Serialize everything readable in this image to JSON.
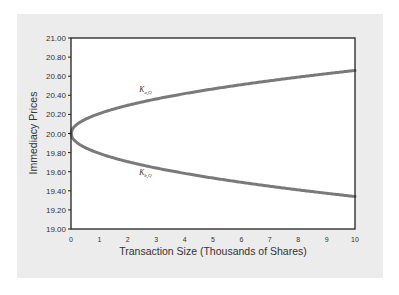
{
  "chart_data": {
    "type": "line",
    "title": "",
    "xlabel": "Transaction Size (Thousands of Shares)",
    "ylabel": "Immediacy Prices",
    "xlim": [
      0,
      10
    ],
    "ylim": [
      19.0,
      21.0
    ],
    "x_ticks": [
      "0",
      "1",
      "2",
      "3",
      "4",
      "5",
      "6",
      "7",
      "8",
      "9",
      "10"
    ],
    "y_ticks": [
      "19.00",
      "19.20",
      "19.40",
      "19.60",
      "19.80",
      "20.00",
      "20.20",
      "20.40",
      "20.60",
      "20.80",
      "21.00"
    ],
    "grid": false,
    "legend": null,
    "x": [
      0,
      0.25,
      0.5,
      1,
      1.5,
      2,
      3,
      4,
      5,
      6,
      7,
      8,
      9,
      10
    ],
    "series": [
      {
        "name": "K_a,Q",
        "label_main": "K",
        "label_sub": "a,Q",
        "values": [
          20.0,
          20.1,
          20.15,
          20.21,
          20.26,
          20.3,
          20.36,
          20.42,
          20.47,
          20.51,
          20.55,
          20.59,
          20.63,
          20.66
        ],
        "color": "#7a7a7a"
      },
      {
        "name": "K_b,Q",
        "label_main": "K",
        "label_sub": "b,Q",
        "values": [
          20.0,
          19.9,
          19.85,
          19.79,
          19.74,
          19.7,
          19.64,
          19.58,
          19.53,
          19.49,
          19.45,
          19.41,
          19.37,
          19.34
        ],
        "color": "#7a7a7a"
      }
    ],
    "annotations": [
      {
        "text": "K_a,Q",
        "x": 2.4,
        "y": 20.43
      },
      {
        "text": "K_b,Q",
        "x": 2.4,
        "y": 19.57
      }
    ]
  },
  "colors": {
    "panel_background": "#ececec",
    "plot_background": "#ffffff",
    "axis": "#222222",
    "curve": "#7a7a7a"
  }
}
